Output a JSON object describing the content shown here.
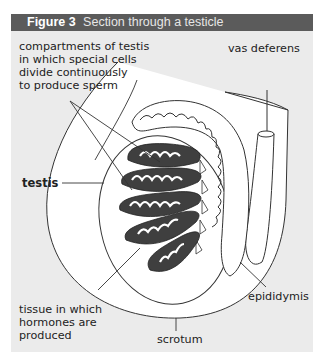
{
  "figure": {
    "number": "Figure 3",
    "title": "Section through a testicle"
  },
  "labels": {
    "compartments": {
      "line1": "compartments of testis",
      "line2": "in which special cells",
      "line3": "divide continuously",
      "line4": "to produce sperm"
    },
    "vas_deferens": "vas deferens",
    "testis": "testis",
    "tissue": {
      "line1": "tissue in which",
      "line2": "hormones are",
      "line3": "produced"
    },
    "scrotum": "scrotum",
    "epididymis": "epididymis"
  },
  "colors": {
    "panel_bg": "#ebebeb",
    "header_bg": "#5b5b5b",
    "lobule_fill": "#3f3f3f",
    "outline": "#333333"
  }
}
